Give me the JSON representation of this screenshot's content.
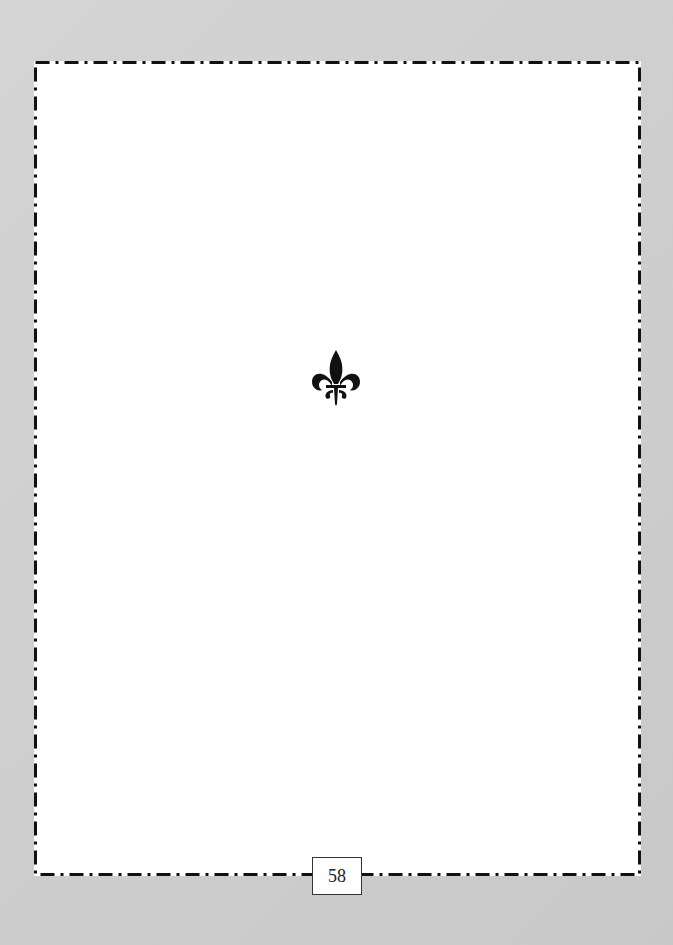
{
  "page": {
    "page_number": "58",
    "ornament": "fleur-de-lis-icon",
    "border_style": "dash-dot",
    "colors": {
      "background": "#cfcfcf",
      "page": "#ffffff",
      "ink": "#111111"
    }
  }
}
